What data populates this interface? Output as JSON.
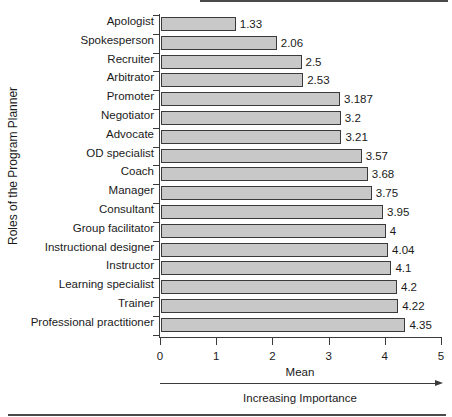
{
  "chart_data": {
    "type": "bar",
    "orientation": "horizontal",
    "title": "",
    "categories": [
      "Apologist",
      "Spokesperson",
      "Recruiter",
      "Arbitrator",
      "Promoter",
      "Negotiator",
      "Advocate",
      "OD specialist",
      "Coach",
      "Manager",
      "Consultant",
      "Group facilitator",
      "Instructional designer",
      "Instructor",
      "Learning specialist",
      "Trainer",
      "Professional practitioner"
    ],
    "values": [
      1.33,
      2.06,
      2.5,
      2.53,
      3.187,
      3.2,
      3.21,
      3.57,
      3.68,
      3.75,
      3.95,
      4,
      4.04,
      4.1,
      4.2,
      4.22,
      4.35
    ],
    "value_labels": [
      "1.33",
      "2.06",
      "2.5",
      "2.53",
      "3.187",
      "3.2",
      "3.21",
      "3.57",
      "3.68",
      "3.75",
      "3.95",
      "4",
      "4.04",
      "4.1",
      "4.2",
      "4.22",
      "4.35"
    ],
    "xlabel": "Mean",
    "ylabel": "Roles of the Program Planner",
    "xlim": [
      0,
      5
    ],
    "xticks": [
      "0",
      "1",
      "2",
      "3",
      "4",
      "5"
    ],
    "annotation": "Increasing Importance",
    "grid": false,
    "legend": null,
    "bar_color": "#c8c8c8"
  }
}
